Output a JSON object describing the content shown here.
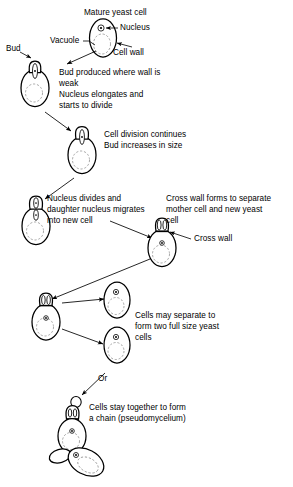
{
  "figure": {
    "topic": "Yeast budding life cycle",
    "background_color": "#ffffff",
    "ink_color": "#000000",
    "vacuole_color": "#8a8a8a"
  },
  "labels": {
    "mature_yeast_cell": "Mature yeast cell",
    "nucleus": "Nucleus",
    "vacuole": "Vacuole",
    "cell_wall": "Cell wall",
    "bud": "Bud",
    "cross_wall": "Cross wall",
    "or": "Or"
  },
  "captions": {
    "step2_line1": "Bud produced where wall is",
    "step2_line2": "weak",
    "step2_line3": "Nucleus elongates and",
    "step2_line4": "starts to divide",
    "step3_line1": "Cell division continues",
    "step3_line2": "Bud increases in size",
    "step4_line1": "Nucleus divides and",
    "step4_line2": "daughter nucleus migrates",
    "step4_line3": "into new cell",
    "step5_line1": "Cross wall forms to separate",
    "step5_line2": "mother cell and new yeast",
    "step5_line3": "cell",
    "step6_line1": "Cells may separate to",
    "step6_line2": "form two full size yeast",
    "step6_line3": "cells",
    "step7_line1": "Cells stay together to form",
    "step7_line2": "a chain (pseudomycelium)"
  },
  "cells": [
    {
      "id": "mature-yeast-cell",
      "stage": 1,
      "description": "Mature yeast cell with nucleus and vacuole",
      "has_bud": false,
      "nuclei": 1
    },
    {
      "id": "budding-cell-small-bud",
      "stage": 2,
      "description": "Small bud with elongating nucleus",
      "has_bud": true,
      "nuclei": 1
    },
    {
      "id": "budding-cell-growing-bud",
      "stage": 3,
      "description": "Bud increases in size, nucleus dividing",
      "has_bud": true,
      "nuclei": 1
    },
    {
      "id": "budding-cell-two-nuclei",
      "stage": 4,
      "description": "Nucleus divided, daughter nucleus migrating into bud",
      "has_bud": true,
      "nuclei": 2
    },
    {
      "id": "cell-with-cross-wall",
      "stage": 5,
      "description": "Cross wall formed between mother cell and bud",
      "has_bud": true,
      "nuclei": 2
    },
    {
      "id": "separating-mother-cell",
      "stage": 6,
      "description": "Mother cell with attached bud before separation",
      "has_bud": true,
      "nuclei": 2
    },
    {
      "id": "separate-cell-upper",
      "stage": 6,
      "description": "Full size separated yeast cell",
      "has_bud": false,
      "nuclei": 1
    },
    {
      "id": "separate-cell-lower",
      "stage": 6,
      "description": "Full size separated yeast cell",
      "has_bud": false,
      "nuclei": 1
    },
    {
      "id": "pseudomycelium-chain",
      "stage": 7,
      "description": "Cells remaining attached forming a chain",
      "has_bud": true,
      "nuclei": 2
    }
  ]
}
